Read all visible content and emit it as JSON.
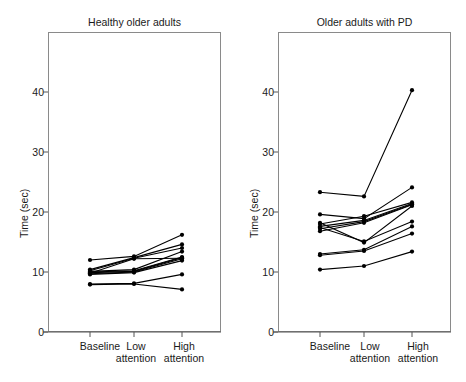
{
  "figure": {
    "background_color": "#ffffff",
    "line_color": "#000000",
    "frame_color": "#8a8a8a"
  },
  "chart_data": [
    {
      "type": "line",
      "title": "Healthy older adults",
      "xlabel": "",
      "ylabel": "Time (sec)",
      "categories": [
        "Baseline",
        "Low attention",
        "High attention"
      ],
      "ylim": [
        0,
        50
      ],
      "yticks": [
        0,
        10,
        20,
        30,
        40
      ],
      "ytick_labels": [
        "0",
        "10",
        "20",
        "30",
        "40"
      ],
      "grid": false,
      "legend": "none",
      "markers": "filled-circle",
      "series": [
        {
          "name": "S1",
          "values": [
            12.0,
            12.6,
            16.2
          ]
        },
        {
          "name": "S2",
          "values": [
            10.4,
            12.4,
            14.6
          ]
        },
        {
          "name": "S3",
          "values": [
            10.2,
            12.3,
            14.0
          ]
        },
        {
          "name": "S4",
          "values": [
            10.1,
            10.4,
            13.4
          ]
        },
        {
          "name": "S5",
          "values": [
            10.0,
            10.2,
            12.5
          ]
        },
        {
          "name": "S6",
          "values": [
            9.9,
            10.1,
            12.4
          ]
        },
        {
          "name": "S7",
          "values": [
            9.8,
            12.2,
            12.3
          ]
        },
        {
          "name": "S8",
          "values": [
            9.7,
            10.0,
            12.2
          ]
        },
        {
          "name": "S9",
          "values": [
            9.6,
            9.9,
            11.9
          ]
        },
        {
          "name": "S10",
          "values": [
            8.0,
            8.1,
            9.6
          ]
        },
        {
          "name": "S11",
          "values": [
            7.9,
            8.0,
            7.1
          ]
        }
      ]
    },
    {
      "type": "line",
      "title": "Older adults with PD",
      "xlabel": "",
      "ylabel": "Time (sec)",
      "categories": [
        "Baseline",
        "Low attention",
        "High attention"
      ],
      "ylim": [
        0,
        50
      ],
      "yticks": [
        0,
        10,
        20,
        30,
        40
      ],
      "ytick_labels": [
        "0",
        "10",
        "20",
        "30",
        "40"
      ],
      "grid": false,
      "legend": "none",
      "markers": "filled-circle",
      "series": [
        {
          "name": "P1",
          "values": [
            23.3,
            22.6,
            40.3
          ]
        },
        {
          "name": "P2",
          "values": [
            19.6,
            18.9,
            24.1
          ]
        },
        {
          "name": "P3",
          "values": [
            18.0,
            19.3,
            21.6
          ]
        },
        {
          "name": "P4",
          "values": [
            17.6,
            18.6,
            21.4
          ]
        },
        {
          "name": "P5",
          "values": [
            17.2,
            18.4,
            21.3
          ]
        },
        {
          "name": "P6",
          "values": [
            16.8,
            18.2,
            21.2
          ]
        },
        {
          "name": "P7",
          "values": [
            17.4,
            15.1,
            18.4
          ]
        },
        {
          "name": "P8",
          "values": [
            13.0,
            13.7,
            17.6
          ]
        },
        {
          "name": "P9",
          "values": [
            12.8,
            13.5,
            16.4
          ]
        },
        {
          "name": "P10",
          "values": [
            10.4,
            11.0,
            13.4
          ]
        },
        {
          "name": "P11",
          "values": [
            18.2,
            14.9,
            21.0
          ]
        }
      ]
    }
  ]
}
